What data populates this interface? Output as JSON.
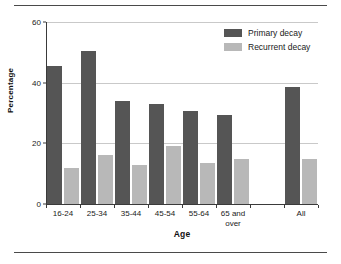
{
  "chart_data": {
    "type": "bar",
    "title": "",
    "xlabel": "Age",
    "ylabel": "Percentage",
    "categories": [
      "16-24",
      "25-34",
      "35-44",
      "45-54",
      "55-64",
      "65 and over",
      "",
      "All"
    ],
    "series": [
      {
        "name": "Primary decay",
        "color": "#555555",
        "values": [
          45.5,
          50.5,
          34,
          33,
          30.5,
          29.5,
          null,
          38.5
        ]
      },
      {
        "name": "Recurrent decay",
        "color": "#b8b8b8",
        "values": [
          12,
          16,
          13,
          19,
          13.5,
          15,
          null,
          15
        ]
      }
    ],
    "ylim": [
      0,
      60
    ],
    "yticks": [
      0,
      20,
      40,
      60
    ],
    "ytick_labels": [
      "0",
      "20",
      "40",
      "60"
    ],
    "grid": true,
    "legend_position": "top-right"
  },
  "legend": {
    "items": [
      {
        "label": "Primary decay",
        "color": "#555555"
      },
      {
        "label": "Recurrent decay",
        "color": "#b8b8b8"
      }
    ]
  },
  "axes": {
    "y_title": "Percentage",
    "x_title": "Age"
  }
}
